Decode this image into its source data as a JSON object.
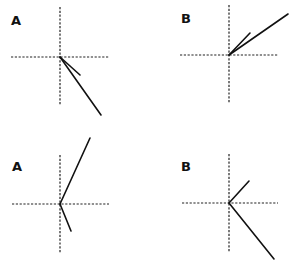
{
  "diagram": {
    "ink_color": "#111111",
    "background": "#ffffff",
    "panels": [
      {
        "label": "A",
        "row": "top",
        "column": "left",
        "vectors": [
          {
            "name": "short",
            "direction": "down-right",
            "relative_length": "short"
          },
          {
            "name": "long",
            "direction": "down-right (steeper)",
            "relative_length": "long"
          }
        ]
      },
      {
        "label": "B",
        "row": "top",
        "column": "right",
        "vectors": [
          {
            "name": "short",
            "direction": "up-right (steeper)",
            "relative_length": "short"
          },
          {
            "name": "long",
            "direction": "up-right (shallow)",
            "relative_length": "long"
          }
        ]
      },
      {
        "label": "A",
        "row": "bottom",
        "column": "left",
        "vectors": [
          {
            "name": "long",
            "direction": "up-right",
            "relative_length": "long"
          },
          {
            "name": "short",
            "direction": "down-right",
            "relative_length": "short"
          }
        ]
      },
      {
        "label": "B",
        "row": "bottom",
        "column": "right",
        "vectors": [
          {
            "name": "short",
            "direction": "up-right",
            "relative_length": "short"
          },
          {
            "name": "long",
            "direction": "down-right",
            "relative_length": "long"
          }
        ]
      }
    ]
  }
}
